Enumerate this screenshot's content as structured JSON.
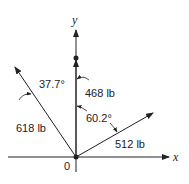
{
  "diagram": {
    "axes": {
      "x_label": "x",
      "y_label": "y",
      "origin_label": "0"
    },
    "forces": [
      {
        "name": "618 lb",
        "label": "618 lb",
        "angle_label": "37.7°",
        "reference": "from +y axis, toward -x"
      },
      {
        "name": "468 lb",
        "label": "468 lb",
        "angle_label": "",
        "reference": "along +y axis"
      },
      {
        "name": "512 lb",
        "label": "512 lb",
        "angle_label": "60.2°",
        "reference": "from +y axis, toward +x"
      }
    ],
    "colors": {
      "stroke": "#222222",
      "background": "#ffffff"
    }
  }
}
